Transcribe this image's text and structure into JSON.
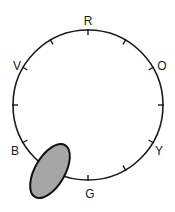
{
  "diagram": {
    "type": "color-wheel-dial",
    "circle": {
      "cx": 88,
      "cy": 105,
      "r": 75,
      "stroke": "#1a1a1a"
    },
    "ticks_count": 12,
    "labels": [
      {
        "text": "R",
        "x": 88,
        "y": 25
      },
      {
        "text": "O",
        "x": 162,
        "y": 68
      },
      {
        "text": "Y",
        "x": 159,
        "y": 153
      },
      {
        "text": "G",
        "x": 90,
        "y": 197
      },
      {
        "text": "B",
        "x": 15,
        "y": 153
      },
      {
        "text": "V",
        "x": 17,
        "y": 68
      }
    ],
    "marker": {
      "shape": "ellipse",
      "cx": 50,
      "cy": 171,
      "rx": 15,
      "ry": 30,
      "rotate": 30,
      "fill": "#a6a6a6",
      "stroke": "#111111"
    }
  }
}
